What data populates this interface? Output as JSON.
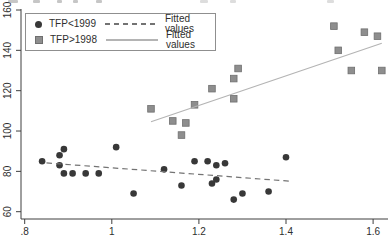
{
  "legend": {
    "rows": [
      {
        "marker": "circle",
        "series_label": "TFP<1999",
        "line_style": "dashed",
        "fit_label": "Fitted values"
      },
      {
        "marker": "square",
        "series_label": "TFP>1998",
        "line_style": "solid",
        "fit_label": "Fitted values"
      }
    ]
  },
  "colors": {
    "circle_series": "#383838",
    "square_series": "#8e8e8e",
    "square_border": "#6f6f6f",
    "dashed_fit_line": "#737373",
    "solid_fit_line": "#b4b4b4",
    "axis": "#3f3f3f",
    "tick_text": "#2e2e2e",
    "background": "#ffffff"
  },
  "chart_data": {
    "type": "scatter",
    "title": "",
    "xlabel": "",
    "ylabel": "",
    "grid": false,
    "legend_position": "top-left",
    "xlim": [
      0.79,
      1.64
    ],
    "ylim": [
      56,
      162
    ],
    "x_ticks": [
      0.8,
      1.0,
      1.2,
      1.4,
      1.6
    ],
    "x_tick_labels": [
      ".8",
      "1",
      "1.2",
      "1.4",
      "1.6"
    ],
    "y_ticks": [
      60,
      80,
      100,
      120,
      140,
      160
    ],
    "y_tick_labels": [
      "60",
      "80",
      "100",
      "120",
      "140",
      "160"
    ],
    "series": [
      {
        "name": "TFP<1999",
        "kind": "scatter",
        "marker": "circle",
        "points": [
          [
            0.84,
            85
          ],
          [
            0.89,
            91
          ],
          [
            0.88,
            88
          ],
          [
            0.88,
            83
          ],
          [
            0.89,
            79
          ],
          [
            0.91,
            79
          ],
          [
            0.94,
            79
          ],
          [
            0.97,
            79
          ],
          [
            1.01,
            92
          ],
          [
            1.05,
            69
          ],
          [
            1.12,
            81
          ],
          [
            1.16,
            73
          ],
          [
            1.19,
            85
          ],
          [
            1.22,
            85
          ],
          [
            1.24,
            83
          ],
          [
            1.26,
            84
          ],
          [
            1.24,
            76
          ],
          [
            1.23,
            74
          ],
          [
            1.28,
            66
          ],
          [
            1.3,
            69
          ],
          [
            1.36,
            70
          ],
          [
            1.4,
            87
          ]
        ]
      },
      {
        "name": "TFP>1998",
        "kind": "scatter",
        "marker": "square",
        "points": [
          [
            1.09,
            111
          ],
          [
            1.14,
            105
          ],
          [
            1.17,
            104
          ],
          [
            1.16,
            98
          ],
          [
            1.19,
            113
          ],
          [
            1.23,
            121
          ],
          [
            1.28,
            126
          ],
          [
            1.28,
            116
          ],
          [
            1.29,
            131
          ],
          [
            1.51,
            152
          ],
          [
            1.52,
            140
          ],
          [
            1.55,
            130
          ],
          [
            1.58,
            149
          ],
          [
            1.61,
            147
          ],
          [
            1.62,
            130
          ]
        ]
      },
      {
        "name": "Fitted values (TFP<1999)",
        "kind": "line",
        "style": "dashed",
        "points": [
          [
            0.85,
            84.2
          ],
          [
            1.41,
            75.1
          ]
        ]
      },
      {
        "name": "Fitted values (TFP>1998)",
        "kind": "line",
        "style": "solid",
        "points": [
          [
            1.09,
            104.6
          ],
          [
            1.62,
            143.5
          ]
        ]
      }
    ]
  }
}
